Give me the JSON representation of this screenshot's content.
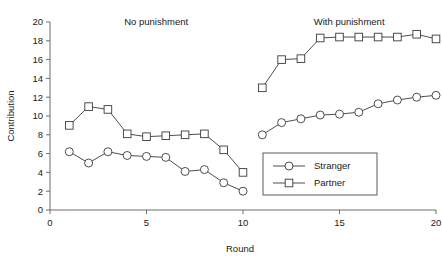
{
  "chart_data": {
    "type": "line",
    "title": "",
    "xlabel": "Round",
    "ylabel": "Contribution",
    "xlim": [
      0,
      20
    ],
    "ylim": [
      0,
      20
    ],
    "xticks": [
      0,
      5,
      10,
      15,
      20
    ],
    "yticks": [
      0,
      2,
      4,
      6,
      8,
      10,
      12,
      14,
      16,
      18,
      20
    ],
    "xtick_labels": [
      "0",
      "5",
      "10",
      "15",
      "20"
    ],
    "ytick_labels": [
      "0",
      "2",
      "4",
      "6",
      "8",
      "10",
      "12",
      "14",
      "16",
      "18",
      "20"
    ],
    "grid": false,
    "legend_position": "center-right-inside",
    "annotations": [
      {
        "text": "No punishment",
        "x": 5.5,
        "y": 19.7
      },
      {
        "text": "With punishment",
        "x": 15.5,
        "y": 19.7
      }
    ],
    "x": [
      1,
      2,
      3,
      4,
      5,
      6,
      7,
      8,
      9,
      10,
      11,
      12,
      13,
      14,
      15,
      16,
      17,
      18,
      19,
      20
    ],
    "series": [
      {
        "name": "Stranger",
        "marker": "circle",
        "values": [
          6.2,
          5.0,
          6.2,
          5.8,
          5.7,
          5.6,
          4.1,
          4.3,
          2.9,
          2.0,
          8.0,
          9.3,
          9.7,
          10.1,
          10.2,
          10.4,
          11.3,
          11.7,
          12.0,
          12.2
        ]
      },
      {
        "name": "Partner",
        "marker": "square",
        "values": [
          9.0,
          11.0,
          10.7,
          8.1,
          7.8,
          7.9,
          8.0,
          8.1,
          6.4,
          4.0,
          13.0,
          16.0,
          16.1,
          18.3,
          18.4,
          18.4,
          18.4,
          18.4,
          18.7,
          18.2
        ]
      }
    ],
    "phase_break_after_round": 10
  },
  "legend": {
    "entries": [
      {
        "label": "Stranger",
        "marker": "circle-marker-icon"
      },
      {
        "label": "Partner",
        "marker": "square-marker-icon"
      }
    ]
  }
}
